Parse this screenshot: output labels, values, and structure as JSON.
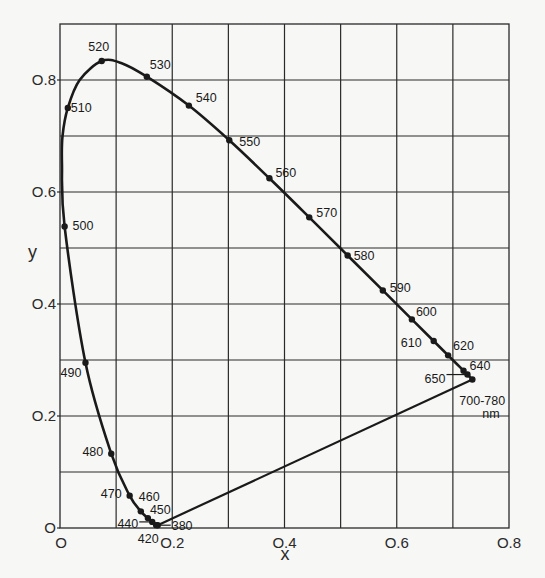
{
  "chart_data": {
    "type": "line",
    "title": "",
    "xlabel": "x",
    "ylabel": "y",
    "xlim": [
      0,
      0.8
    ],
    "ylim": [
      0,
      0.9
    ],
    "grid": true,
    "x_ticks": [
      "0",
      "0.2",
      "0.4",
      "0.6",
      "0.8"
    ],
    "y_ticks": [
      "0",
      "0.2",
      "0.4",
      "0.6",
      "0.8"
    ],
    "series": [
      {
        "name": "spectral locus",
        "unit": "nm",
        "points": [
          {
            "wavelength": "380",
            "x": 0.1741,
            "y": 0.005
          },
          {
            "wavelength": "420",
            "x": 0.1714,
            "y": 0.0051
          },
          {
            "wavelength": "440",
            "x": 0.1644,
            "y": 0.0109
          },
          {
            "wavelength": "450",
            "x": 0.1566,
            "y": 0.0177
          },
          {
            "wavelength": "460",
            "x": 0.144,
            "y": 0.0297
          },
          {
            "wavelength": "470",
            "x": 0.1241,
            "y": 0.0578
          },
          {
            "wavelength": "480",
            "x": 0.0913,
            "y": 0.1327
          },
          {
            "wavelength": "490",
            "x": 0.0454,
            "y": 0.295
          },
          {
            "wavelength": "500",
            "x": 0.0082,
            "y": 0.5384
          },
          {
            "wavelength": "510",
            "x": 0.0139,
            "y": 0.7502
          },
          {
            "wavelength": "520",
            "x": 0.0743,
            "y": 0.8338
          },
          {
            "wavelength": "530",
            "x": 0.1547,
            "y": 0.8059
          },
          {
            "wavelength": "540",
            "x": 0.2296,
            "y": 0.7543
          },
          {
            "wavelength": "550",
            "x": 0.3016,
            "y": 0.6923
          },
          {
            "wavelength": "560",
            "x": 0.3731,
            "y": 0.6245
          },
          {
            "wavelength": "570",
            "x": 0.4441,
            "y": 0.5547
          },
          {
            "wavelength": "580",
            "x": 0.5125,
            "y": 0.4866
          },
          {
            "wavelength": "590",
            "x": 0.5752,
            "y": 0.4242
          },
          {
            "wavelength": "600",
            "x": 0.627,
            "y": 0.3725
          },
          {
            "wavelength": "610",
            "x": 0.6658,
            "y": 0.334
          },
          {
            "wavelength": "620",
            "x": 0.6915,
            "y": 0.3083
          },
          {
            "wavelength": "640",
            "x": 0.719,
            "y": 0.2809
          },
          {
            "wavelength": "650",
            "x": 0.726,
            "y": 0.274
          },
          {
            "wavelength": "700-780",
            "x": 0.7347,
            "y": 0.2653
          }
        ]
      },
      {
        "name": "purple line",
        "points": [
          {
            "x": 0.1741,
            "y": 0.005
          },
          {
            "x": 0.7347,
            "y": 0.2653
          }
        ]
      }
    ],
    "annotations": [
      "700-780",
      "nm"
    ]
  },
  "labels": {
    "xlabel": "x",
    "ylabel": "y",
    "nm": "nm",
    "range": "700-780"
  }
}
